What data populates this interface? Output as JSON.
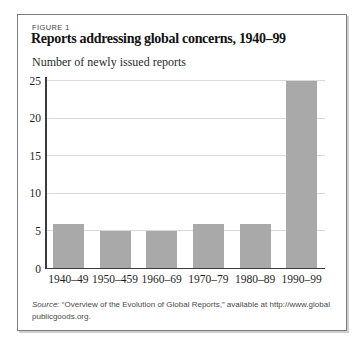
{
  "figure": {
    "label": "FIGURE 1",
    "title": "Reports addressing global concerns, 1940–99",
    "subtitle": "Number of newly issued reports"
  },
  "chart_data": {
    "type": "bar",
    "categories": [
      "1940–49",
      "1950–459",
      "1960–69",
      "1970–79",
      "1980–89",
      "1990–99"
    ],
    "values": [
      6,
      5,
      5,
      6,
      6,
      25
    ],
    "title": "Reports addressing global concerns, 1940–99",
    "xlabel": "",
    "ylabel": "Number of newly issued reports",
    "ylim": [
      0,
      25
    ],
    "yticks": [
      0,
      5,
      10,
      15,
      20,
      25
    ],
    "grid": true,
    "legend": "none",
    "bar_color": "#a9a9a9"
  },
  "source": {
    "prefix": "Source:",
    "line1": "“Overview of the Evolution of Global Reports,” available at http://www.global",
    "line2": "publicgoods.org."
  },
  "colors": {
    "bar": "#a9a9a9",
    "gridline": "#d9d9d9",
    "axis": "#3c3c3c",
    "box_border": "#7d7d7d",
    "title_text": "#121212",
    "source_text": "#4a4a4a"
  }
}
